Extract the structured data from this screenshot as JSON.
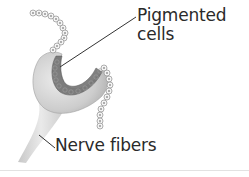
{
  "figure": {
    "labels": {
      "pigmented_cells": "Pigmented\ncells",
      "nerve_fibers": "Nerve fibers"
    },
    "colors": {
      "cup_tissue": "#cfcfcf",
      "pigment": "#6b6b6b",
      "cell_outline": "#a8a8a8",
      "leader_line": "#333333",
      "text": "#2a2a2a"
    }
  }
}
